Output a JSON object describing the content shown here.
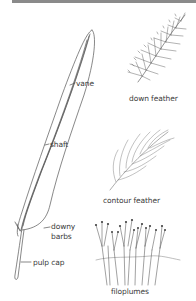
{
  "diagram": {
    "main_feather": {
      "labels": {
        "vane": "vane",
        "shaft": "shaft",
        "downy_barbs_line1": "downy",
        "downy_barbs_line2": "barbs",
        "pulp_cap": "pulp cap"
      }
    },
    "examples": [
      {
        "id": "down",
        "label": "down feather"
      },
      {
        "id": "contour",
        "label": "contour feather"
      },
      {
        "id": "filoplumes",
        "label": "filoplumes"
      }
    ],
    "colors": {
      "line": "#555555",
      "text": "#3a3a3a",
      "top_bar": "#8a8a8a",
      "background": "#ffffff"
    }
  }
}
